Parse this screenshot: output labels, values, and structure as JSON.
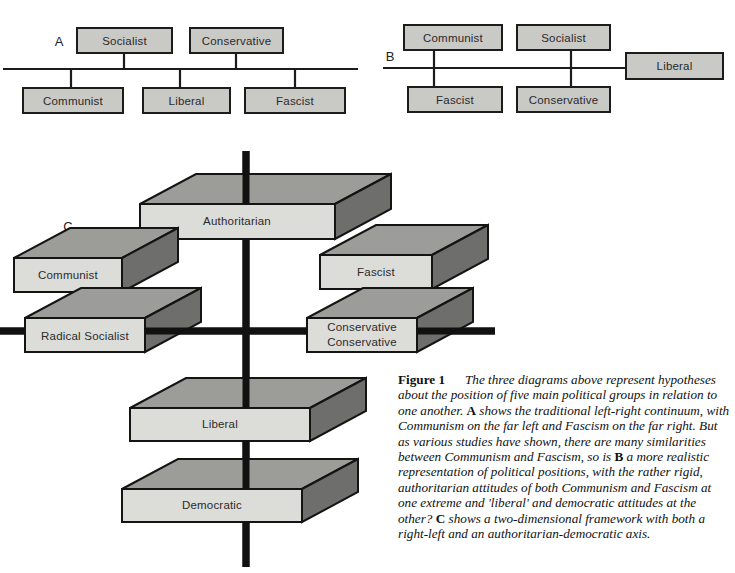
{
  "figure": {
    "number_label": "Figure 1",
    "caption_intro": "The three diagrams above represent hypotheses about the position of five main political groups in relation to one another.",
    "caption_a_letter": "A",
    "caption_a_text": " shows the traditional left-right continuum, with Communism on the far left and Fascism on the far right. But as various studies have shown, there are many similarities between Communism and Fascism, so is ",
    "caption_b_letter": "B",
    "caption_b_text": " a more realistic representation of political positions, with the rather rigid, authoritarian attitudes of both Communism and Fascism at one extreme and 'liberal' and democratic attitudes at the other?",
    "caption_c_letter": "C",
    "caption_c_text": " shows a two-dimensional framework with both a right-left and an authoritarian-democratic axis."
  },
  "colors": {
    "box_fill": "#c9c9c6",
    "slab_front": "#dcdcd9",
    "slab_top": "#9c9c99",
    "slab_side": "#6e6e6c",
    "stroke": "#1c1c1c",
    "page_background": "#ffffff"
  },
  "diagram_a": {
    "letter": "A",
    "axis_label": "left-right continuum",
    "boxes_above": [
      {
        "label": "Socialist",
        "x": 77,
        "y": 28,
        "w": 95,
        "h": 25,
        "stem_x": 124
      },
      {
        "label": "Conservative",
        "x": 190,
        "y": 28,
        "w": 93,
        "h": 25,
        "stem_x": 236
      }
    ],
    "boxes_below": [
      {
        "label": "Communist",
        "x": 23,
        "y": 88,
        "w": 100,
        "h": 25,
        "stem_x": 71
      },
      {
        "label": "Liberal",
        "x": 143,
        "y": 88,
        "w": 87,
        "h": 25,
        "stem_x": 180
      },
      {
        "label": "Fascist",
        "x": 245,
        "y": 88,
        "w": 100,
        "h": 25,
        "stem_x": 295
      }
    ],
    "axis": {
      "x1": 3,
      "x2": 358,
      "y": 69
    }
  },
  "diagram_b": {
    "letter": "B",
    "axis_label": "authoritarian-democratic spread",
    "boxes_above": [
      {
        "label": "Communist",
        "x": 404,
        "y": 25,
        "w": 98,
        "h": 25,
        "stem_x": 434
      },
      {
        "label": "Socialist",
        "x": 517,
        "y": 25,
        "w": 93,
        "h": 25,
        "stem_x": 571
      }
    ],
    "boxes_below": [
      {
        "label": "Fascist",
        "x": 408,
        "y": 87,
        "w": 94,
        "h": 25,
        "stem_x": 434
      },
      {
        "label": "Conservative",
        "x": 517,
        "y": 87,
        "w": 93,
        "h": 25,
        "stem_x": 571
      }
    ],
    "boxes_on_axis": [
      {
        "label": "Liberal",
        "x": 626,
        "y": 53,
        "w": 97,
        "h": 26
      }
    ],
    "axis": {
      "x1": 383,
      "x2": 628,
      "y": 68
    }
  },
  "diagram_c": {
    "letter": "C",
    "letter_pos": {
      "x": 68,
      "y": 228
    },
    "vertical_axis": {
      "x": 246,
      "y1": 151,
      "y2": 567,
      "label_top": "Authoritarian",
      "label_bottom": "Democratic"
    },
    "horizontal_axis": {
      "y": 331,
      "x1": 0,
      "x2": 495,
      "label_left": "Radical Socialist",
      "label_right": "Conservative"
    },
    "slabs": [
      {
        "label": "Authoritarian",
        "fx": 140,
        "fy": 204,
        "fw": 195,
        "fh": 35,
        "dx": 56,
        "dy": -30
      },
      {
        "label": "Communist",
        "fx": 14,
        "fy": 258,
        "fw": 108,
        "fh": 34,
        "dx": 56,
        "dy": -30
      },
      {
        "label": "Fascist",
        "fx": 320,
        "fy": 255,
        "fw": 112,
        "fh": 34,
        "dx": 56,
        "dy": -30
      },
      {
        "label": "Radical  Socialist",
        "fx": 25,
        "fy": 318,
        "fw": 120,
        "fh": 34,
        "dx": 56,
        "dy": -30
      },
      {
        "label": "Conservative",
        "label2": "Conservative",
        "fx": 307,
        "fy": 318,
        "fw": 110,
        "fh": 34,
        "dx": 56,
        "dy": -30
      },
      {
        "label": "Liberal",
        "fx": 130,
        "fy": 408,
        "fw": 180,
        "fh": 33,
        "dx": 56,
        "dy": -30
      },
      {
        "label": "Democratic",
        "fx": 122,
        "fy": 489,
        "fw": 180,
        "fh": 33,
        "dx": 56,
        "dy": -30
      }
    ]
  }
}
